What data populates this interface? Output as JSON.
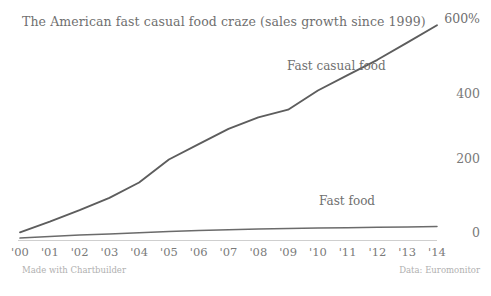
{
  "chart_data": {
    "type": "line",
    "title": "The American fast casual food craze (sales growth since 1999)",
    "xlabel": "",
    "ylabel": "",
    "ylim": [
      0,
      600
    ],
    "xlim": [
      2000,
      2014
    ],
    "grid": false,
    "legend_position": "inline-annotation",
    "y_ticks": [
      0,
      200,
      400,
      600
    ],
    "y_tick_labels": [
      "0",
      "200",
      "400",
      "600%"
    ],
    "categories": [
      "'00",
      "'01",
      "'02",
      "'03",
      "'04",
      "'05",
      "'06",
      "'07",
      "'08",
      "'09",
      "'10",
      "'11",
      "'12",
      "'13",
      "'14"
    ],
    "x": [
      2000,
      2001,
      2002,
      2003,
      2004,
      2005,
      2006,
      2007,
      2008,
      2009,
      2010,
      2011,
      2012,
      2013,
      2014
    ],
    "series": [
      {
        "name": "Fast casual food",
        "color": "#5d5d5d",
        "values": [
          20,
          48,
          78,
          110,
          150,
          210,
          250,
          290,
          320,
          340,
          390,
          430,
          470,
          515,
          560
        ]
      },
      {
        "name": "Fast food",
        "color": "#6b6b6b",
        "values": [
          5,
          9,
          13,
          16,
          19,
          22,
          25,
          27,
          29,
          30,
          31,
          32,
          33,
          34,
          35
        ]
      }
    ],
    "annotations": [
      {
        "text": "Fast casual food",
        "series": "Fast casual food"
      },
      {
        "text": "Fast food",
        "series": "Fast food"
      }
    ]
  },
  "footer": {
    "credit": "Made with Chartbuilder",
    "source": "Data: Euromonitor"
  },
  "colors": {
    "background": "#ffffff",
    "text": "#6f6f6f",
    "tick": "#7a7a7a",
    "axis": "#cfcfcf",
    "footer": "#b0b0b0",
    "line_primary": "#5d5d5d",
    "line_secondary": "#6b6b6b"
  }
}
